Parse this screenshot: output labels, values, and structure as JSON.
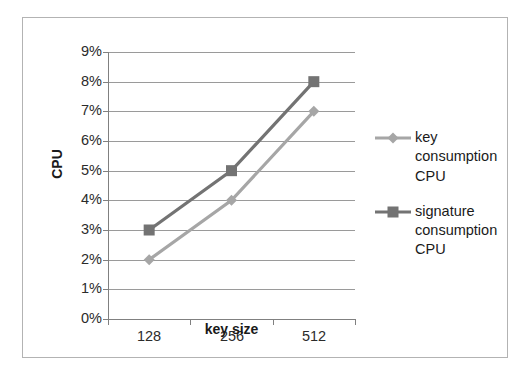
{
  "chart_data": {
    "type": "line",
    "title": "",
    "xlabel": "key size",
    "ylabel": "CPU",
    "categories": [
      "128",
      "256",
      "512"
    ],
    "ytick_labels": [
      "0%",
      "1%",
      "2%",
      "3%",
      "4%",
      "5%",
      "6%",
      "7%",
      "8%",
      "9%"
    ],
    "ylim": [
      0,
      9
    ],
    "ytick_step": 1,
    "grid": true,
    "legend_position": "right",
    "series": [
      {
        "name": "key consumption CPU",
        "values": [
          2,
          4,
          7
        ],
        "color": "#a6a6a6",
        "marker": "diamond"
      },
      {
        "name": "signature consumption CPU",
        "values": [
          3,
          5,
          8
        ],
        "color": "#737373",
        "marker": "square"
      }
    ]
  },
  "legend": {
    "entries": [
      {
        "label": "key consumption CPU"
      },
      {
        "label": "signature consumption CPU"
      }
    ]
  },
  "axes": {
    "y_title": "CPU",
    "x_title": "key size"
  },
  "colors": {
    "frame": "#b3b3b3",
    "gridline": "#9a9a9a",
    "axis": "#808080",
    "series_light": "#a6a6a6",
    "series_dark": "#737373",
    "text": "#1a1a1a"
  }
}
